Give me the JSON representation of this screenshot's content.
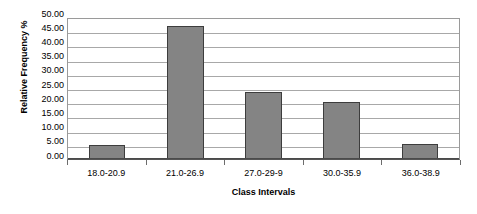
{
  "chart_data": {
    "type": "bar",
    "title": "",
    "subtitle": "",
    "xlabel": "Class Intervals",
    "ylabel": "Relative Frequency %",
    "categories": [
      "18.0-20.9",
      "21.0-26.9",
      "27.0-29-9",
      "30.0-35.9",
      "36.0-38.9"
    ],
    "values": [
      5.1,
      46.8,
      23.7,
      20.2,
      5.3
    ],
    "ylim": [
      0,
      50
    ],
    "ytick_step": 5,
    "ytick_labels": [
      "50.00",
      "45.00",
      "40.00",
      "35.00",
      "30.00",
      "25.00",
      "20.00",
      "15.00",
      "10.00",
      "5.00",
      "0.00"
    ],
    "grid": true,
    "grid_axis": "y",
    "legend": false,
    "legend_position": "none",
    "series": [
      {
        "name": "Relative Frequency %",
        "values": [
          5.1,
          46.8,
          23.7,
          20.2,
          5.3
        ]
      }
    ]
  },
  "colors": {
    "bar_fill": "#848484",
    "bar_border": "#3d3d3d",
    "gridline": "#a8a8a8",
    "plot_border": "#9a9a9a",
    "axis": "#4a4a4a",
    "text": "#000000",
    "background": "#ffffff"
  }
}
